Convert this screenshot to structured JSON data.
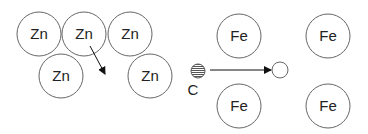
{
  "diagram": {
    "zinc_atoms": [
      {
        "label": "Zn",
        "cx": 39,
        "cy": 34
      },
      {
        "label": "Zn",
        "cx": 84,
        "cy": 34
      },
      {
        "label": "Zn",
        "cx": 130,
        "cy": 34
      },
      {
        "label": "Zn",
        "cx": 61,
        "cy": 76
      },
      {
        "label": "Zn",
        "cx": 150,
        "cy": 76
      }
    ],
    "iron_atoms": [
      {
        "label": "Fe",
        "cx": 239,
        "cy": 36
      },
      {
        "label": "Fe",
        "cx": 328,
        "cy": 36
      },
      {
        "label": "Fe",
        "cx": 239,
        "cy": 106
      },
      {
        "label": "Fe",
        "cx": 328,
        "cy": 106
      }
    ],
    "carbon": {
      "label": "C"
    },
    "colors": {
      "stroke": "#555555",
      "text": "#222222",
      "hatch": "#666666"
    }
  }
}
